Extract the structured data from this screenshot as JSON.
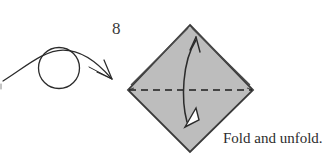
{
  "figure": {
    "step_number": "8",
    "caption": "Fold and unfold.",
    "colors": {
      "background": "#ffffff",
      "paper_fill": "#bdbdbd",
      "paper_edge": "#3a3a3a",
      "fold_line": "#1d1d1d",
      "arrow_stroke": "#2b2b2b",
      "arrow_head_fill": "#ffffff",
      "text": "#2d2d2d"
    },
    "shapes": {
      "diamond": {
        "name": "square-base-diamond",
        "top": [
          190,
          25
        ],
        "right": [
          253,
          90
        ],
        "bottom": [
          190,
          152
        ],
        "left": [
          128,
          90
        ]
      },
      "fold_line": {
        "name": "horizontal-valley-fold",
        "style": "dashed",
        "from": [
          128,
          90
        ],
        "to": [
          253,
          90
        ]
      },
      "flap_edges": [
        {
          "name": "upper-left-layered-edge",
          "from": [
            130,
            84
          ],
          "to": [
            187,
            27
          ]
        },
        {
          "name": "upper-right-layered-edge",
          "from": [
            251,
            84
          ],
          "to": [
            193,
            27
          ]
        }
      ],
      "fold_unfold_arrow": {
        "name": "fold-and-unfold-double-arrow",
        "head_top": [
          196,
          37
        ],
        "head_bottom": [
          186,
          126
        ],
        "bow_direction": "left"
      },
      "turn_over_symbol": {
        "name": "turn-over-arc-and-circle",
        "circle_center": [
          59,
          68
        ],
        "circle_radius": 20,
        "arc_start": [
          3,
          81
        ],
        "arc_end": [
          112,
          79
        ]
      }
    }
  }
}
